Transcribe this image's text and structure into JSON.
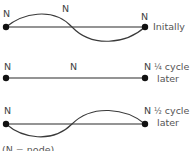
{
  "node_label": "N",
  "rows": [
    {
      "id": "initially",
      "caption_line1": "Initally",
      "caption_line2": "",
      "state": "wave-up-down",
      "nodes": [
        "N",
        "N",
        "N"
      ]
    },
    {
      "id": "quarter-cycle",
      "caption_frac": "¼",
      "caption_line1": " cycle",
      "caption_line2": "later",
      "state": "flat",
      "nodes": [
        "N",
        "N",
        "N"
      ]
    },
    {
      "id": "half-cycle",
      "caption_frac": "½",
      "caption_line1": " cycle",
      "caption_line2": "later",
      "state": "wave-down-up",
      "nodes": [
        "N",
        "N"
      ]
    }
  ],
  "legend": "(N = node)",
  "colors": {
    "string": "#2b2b2b",
    "wave": "#3a3a3a",
    "text": "#444444"
  }
}
